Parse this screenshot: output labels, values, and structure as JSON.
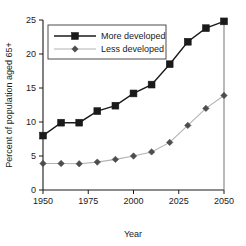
{
  "chart_data": {
    "type": "line",
    "title": "",
    "xlabel": "Year",
    "ylabel": "Percent of population aged 65+",
    "x": [
      1950,
      1960,
      1970,
      1980,
      1990,
      2000,
      2010,
      2020,
      2030,
      2040,
      2050
    ],
    "xlim": [
      1950,
      2050
    ],
    "ylim": [
      0,
      25
    ],
    "xticks": [
      1950,
      1975,
      2000,
      2025,
      2050
    ],
    "xtick_labels": [
      "1950",
      "1975",
      "2000",
      "2025",
      "2050"
    ],
    "yticks": [
      0,
      5,
      10,
      15,
      20,
      25
    ],
    "ytick_labels": [
      "0",
      "5",
      "10",
      "15",
      "20",
      "25"
    ],
    "grid": false,
    "legend_position": "upper-left",
    "series": [
      {
        "name": "More developed",
        "marker": "square",
        "color": "#1a1a1a",
        "line_color": "#1a1a1a",
        "values": [
          8.0,
          9.9,
          9.9,
          11.6,
          12.4,
          14.2,
          15.5,
          18.5,
          21.8,
          23.8,
          24.8
        ]
      },
      {
        "name": "Less developed",
        "marker": "diamond",
        "color": "#4d4d4d",
        "line_color": "#b3b3b3",
        "values": [
          3.9,
          3.9,
          3.85,
          4.1,
          4.5,
          5.0,
          5.6,
          7.0,
          9.5,
          12.0,
          13.9
        ]
      }
    ]
  },
  "legend": {
    "entries": [
      {
        "label": "More developed"
      },
      {
        "label": "Less developed"
      }
    ]
  },
  "axes": {
    "x_title": "Year",
    "y_title": "Percent of population aged 65+"
  }
}
